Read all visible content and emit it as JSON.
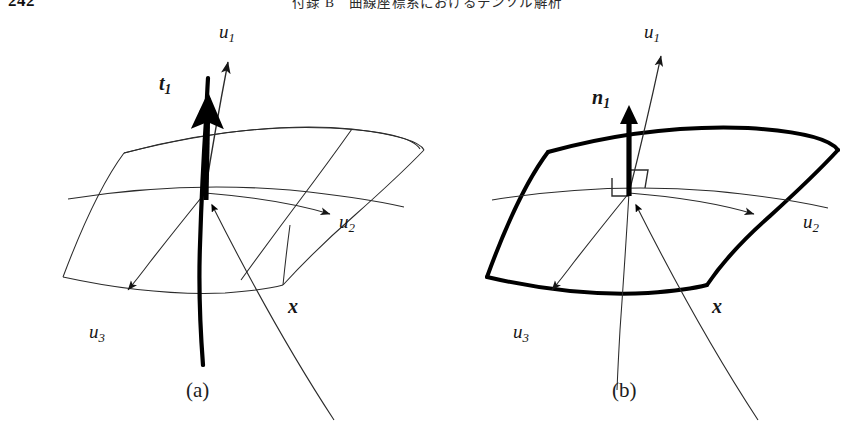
{
  "page": {
    "folio": "242",
    "running_head_left": "付録 B",
    "running_head_right": "曲線座標系におけるテンソル解析",
    "background_color": "#ffffff",
    "ink_color": "#161616"
  },
  "figures": [
    {
      "id": "a",
      "caption": "(a)",
      "description": "curvilinear coordinate surface patch with coordinate curve and tangent base vector",
      "labels": {
        "u1": {
          "base": "u",
          "sub": "1"
        },
        "u2": {
          "base": "u",
          "sub": "2"
        },
        "u3": {
          "base": "u",
          "sub": "3"
        },
        "vector": {
          "base": "t",
          "sub": "1",
          "bold": true
        },
        "position": {
          "base": "x",
          "bold": true
        }
      },
      "elements": [
        "coordinate-surface-grid",
        "coordinate-curve-u1",
        "tangent-vector-t1",
        "axis-arrow-u1",
        "axis-arrow-u2",
        "axis-arrow-u3",
        "position-vector-x"
      ]
    },
    {
      "id": "b",
      "caption": "(b)",
      "description": "curvilinear coordinate surface patch with unit normal base vector and right-angle marks",
      "labels": {
        "u1": {
          "base": "u",
          "sub": "1"
        },
        "u2": {
          "base": "u",
          "sub": "2"
        },
        "u3": {
          "base": "u",
          "sub": "3"
        },
        "vector": {
          "base": "n",
          "sub": "1",
          "bold": true
        },
        "position": {
          "base": "x",
          "bold": true
        }
      },
      "elements": [
        "coordinate-surface-outline",
        "normal-vector-n1",
        "right-angle-mark-left",
        "right-angle-mark-right",
        "axis-arrow-u1",
        "axis-arrow-u2",
        "axis-arrow-u3",
        "position-vector-x"
      ]
    }
  ]
}
